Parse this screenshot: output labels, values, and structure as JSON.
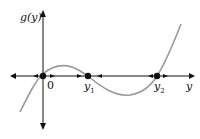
{
  "diagram": {
    "type": "phase-line",
    "y_axis_label": "g(y)",
    "x_axis_label": "y",
    "origin_label": "0",
    "equilibria": [
      {
        "label": "0",
        "stability": "unstable"
      },
      {
        "label": "y",
        "subscript": "1",
        "stability": "stable"
      },
      {
        "label": "y",
        "subscript": "2",
        "stability": "unstable"
      }
    ],
    "colors": {
      "axis": "#111111",
      "curve": "#999999",
      "point": "#111111"
    }
  }
}
